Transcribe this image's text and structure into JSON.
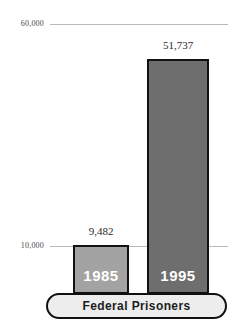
{
  "chart_data": {
    "type": "bar",
    "title": "",
    "subtitle": "",
    "xlabel": "Federal Prisoners",
    "ylabel": "",
    "categories": [
      "1985",
      "1995"
    ],
    "values": [
      9482,
      51737
    ],
    "value_labels": [
      "9,482",
      "51,737"
    ],
    "ylim": [
      0,
      60000
    ],
    "grid": true,
    "gridlines": [
      60000,
      10000
    ],
    "legend": "none",
    "axis_ticks": [
      {
        "value": 60000,
        "label": "60,000"
      },
      {
        "value": 10000,
        "label": "10,000"
      }
    ],
    "series": [
      {
        "name": "Federal Prisoners",
        "points": [
          {
            "category": "1985",
            "value": 9482,
            "label": "9,482",
            "color": "#a3a3a3"
          },
          {
            "category": "1995",
            "value": 51737,
            "label": "51,737",
            "color": "#6e6e6e"
          }
        ]
      }
    ]
  },
  "axis": {
    "top_tick": "60,000",
    "mid_tick": "10,000"
  },
  "bars": {
    "first": {
      "year": "1985",
      "value_label": "9,482"
    },
    "second": {
      "year": "1995",
      "value_label": "51,737"
    }
  },
  "base": {
    "label": "Federal Prisoners"
  },
  "colors": {
    "bar_light": "#a3a3a3",
    "bar_dark": "#6e6e6e",
    "outline": "#111111",
    "gridline": "#b9b9b9",
    "base_fill": "#ededed",
    "text": "#1d1d1d"
  }
}
